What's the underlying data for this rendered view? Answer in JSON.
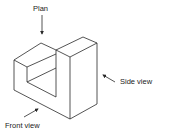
{
  "diagram": {
    "type": "isometric-projection",
    "labels": {
      "plan": "Plan",
      "side_view": "Side view",
      "front_view": "Front view"
    },
    "colors": {
      "line": "#2a2a2a",
      "text": "#222222",
      "background": "#ffffff"
    }
  }
}
